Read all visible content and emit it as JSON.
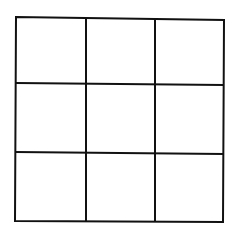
{
  "diagram": {
    "type": "grid",
    "rows": 3,
    "cols": 3,
    "line_color": "#111111",
    "background": "#ffffff",
    "line_width": 2,
    "outer": {
      "top_left": [
        16,
        17
      ],
      "top_right": [
        224,
        20
      ],
      "bottom_right": [
        223,
        222
      ],
      "bottom_left": [
        15,
        221
      ]
    },
    "vertical_lines": [
      {
        "x1": 86,
        "y1": 18,
        "x2": 86,
        "y2": 222
      },
      {
        "x1": 155,
        "y1": 19,
        "x2": 155,
        "y2": 222
      }
    ],
    "horizontal_lines": [
      {
        "x1": 16,
        "y1": 83,
        "x2": 224,
        "y2": 85
      },
      {
        "x1": 15,
        "y1": 152,
        "x2": 224,
        "y2": 154
      }
    ],
    "cells": [
      {
        "row": 0,
        "col": 0,
        "label": ""
      },
      {
        "row": 0,
        "col": 1,
        "label": ""
      },
      {
        "row": 0,
        "col": 2,
        "label": ""
      },
      {
        "row": 1,
        "col": 0,
        "label": ""
      },
      {
        "row": 1,
        "col": 1,
        "label": ""
      },
      {
        "row": 1,
        "col": 2,
        "label": ""
      },
      {
        "row": 2,
        "col": 0,
        "label": ""
      },
      {
        "row": 2,
        "col": 1,
        "label": ""
      },
      {
        "row": 2,
        "col": 2,
        "label": ""
      }
    ]
  }
}
